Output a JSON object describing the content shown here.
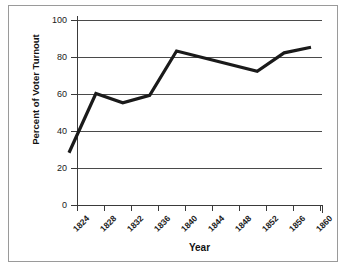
{
  "chart_data": {
    "type": "line",
    "title": "",
    "xlabel": "Year",
    "ylabel": "Percent of Voter Turnout",
    "x": [
      1824,
      1828,
      1832,
      1836,
      1840,
      1844,
      1848,
      1852,
      1856,
      1860
    ],
    "xtick_labels": [
      "1824",
      "1828",
      "1832",
      "1836",
      "1840",
      "1844",
      "1848",
      "1852",
      "1856",
      "1860"
    ],
    "values": [
      25,
      57,
      52,
      56,
      80,
      76.3,
      72.6,
      69,
      79,
      82
    ],
    "vertices": [
      {
        "year": 1824,
        "value": 25
      },
      {
        "year": 1828,
        "value": 57
      },
      {
        "year": 1832,
        "value": 52
      },
      {
        "year": 1836,
        "value": 56
      },
      {
        "year": 1840,
        "value": 80
      },
      {
        "year": 1852,
        "value": 69
      },
      {
        "year": 1856,
        "value": 79
      },
      {
        "year": 1860,
        "value": 82
      }
    ],
    "ylim": [
      0,
      100
    ],
    "yticks": [
      0,
      20,
      40,
      60,
      80,
      100
    ],
    "ytick_labels": [
      "0",
      "20",
      "40",
      "60",
      "80",
      "100"
    ],
    "xlim": [
      1824,
      1860
    ],
    "grid": "horizontal",
    "legend": "none",
    "series_color": "#1a1a1a",
    "gridline_color": "#4a4a4a",
    "axis_color": "#3a3a3a",
    "frame_color": "#9a9a9a",
    "background": "#ffffff"
  }
}
